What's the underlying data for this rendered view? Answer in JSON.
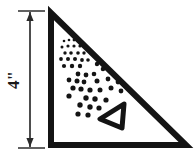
{
  "figure": {
    "background_color": "#ffffff",
    "ink_color": "#141414",
    "dimension": {
      "label": "4\"",
      "value": 4,
      "unit": "inch",
      "orientation": "vertical",
      "label_rotation_deg": -90,
      "line_x": 30,
      "line_top_y": 12,
      "line_bottom_y": 147,
      "arrowhead": "both-ends",
      "extension_top": {
        "x1": 18,
        "x2": 45,
        "y": 11
      },
      "extension_bottom": {
        "x1": 18,
        "x2": 45,
        "y": 148
      },
      "label_x": 19,
      "label_y": 80
    },
    "main_triangle": {
      "name": "right-triangle",
      "apex": {
        "x": 51,
        "y": 13
      },
      "bottom_left": {
        "x": 51,
        "y": 145
      },
      "bottom_right": {
        "x": 186,
        "y": 145
      },
      "stroke_width": 6,
      "fill": "none",
      "right_angle_at": "bottom-left"
    },
    "inner_triangle": {
      "name": "small-outlined-triangle",
      "points": "124,104 100,119 122,128",
      "stroke_width": 5,
      "fill": "none",
      "orientation": "points-left"
    },
    "dot_field": {
      "description": "Scattered round dots, small at upper-left, larger toward lower-right",
      "dots": [
        {
          "cx": 64,
          "cy": 41,
          "r": 1.3
        },
        {
          "cx": 69,
          "cy": 40,
          "r": 1.3
        },
        {
          "cx": 74,
          "cy": 40,
          "r": 1.4
        },
        {
          "cx": 79,
          "cy": 40,
          "r": 1.3
        },
        {
          "cx": 62,
          "cy": 47,
          "r": 1.5
        },
        {
          "cx": 68,
          "cy": 46,
          "r": 1.6
        },
        {
          "cx": 74,
          "cy": 46,
          "r": 1.6
        },
        {
          "cx": 80,
          "cy": 46,
          "r": 1.6
        },
        {
          "cx": 86,
          "cy": 47,
          "r": 1.5
        },
        {
          "cx": 65,
          "cy": 53,
          "r": 1.7
        },
        {
          "cx": 71,
          "cy": 53,
          "r": 1.8
        },
        {
          "cx": 78,
          "cy": 53,
          "r": 1.8
        },
        {
          "cx": 84,
          "cy": 53,
          "r": 1.7
        },
        {
          "cx": 61,
          "cy": 59,
          "r": 1.9
        },
        {
          "cx": 68,
          "cy": 59,
          "r": 2.0
        },
        {
          "cx": 75,
          "cy": 59,
          "r": 2.0
        },
        {
          "cx": 82,
          "cy": 60,
          "r": 1.9
        },
        {
          "cx": 88,
          "cy": 60,
          "r": 1.8
        },
        {
          "cx": 64,
          "cy": 66,
          "r": 2.1
        },
        {
          "cx": 72,
          "cy": 66,
          "r": 2.2
        },
        {
          "cx": 80,
          "cy": 66,
          "r": 2.2
        },
        {
          "cx": 97,
          "cy": 64,
          "r": 2.2
        },
        {
          "cx": 103,
          "cy": 69,
          "r": 2.3
        },
        {
          "cx": 78,
          "cy": 74,
          "r": 2.4
        },
        {
          "cx": 86,
          "cy": 75,
          "r": 2.4
        },
        {
          "cx": 94,
          "cy": 74,
          "r": 2.3
        },
        {
          "cx": 69,
          "cy": 80,
          "r": 2.4
        },
        {
          "cx": 77,
          "cy": 81,
          "r": 2.5
        },
        {
          "cx": 84,
          "cy": 82,
          "r": 2.4
        },
        {
          "cx": 97,
          "cy": 81,
          "r": 2.5
        },
        {
          "cx": 108,
          "cy": 79,
          "r": 2.4
        },
        {
          "cx": 118,
          "cy": 82,
          "r": 2.4
        },
        {
          "cx": 73,
          "cy": 88,
          "r": 2.6
        },
        {
          "cx": 81,
          "cy": 89,
          "r": 2.6
        },
        {
          "cx": 90,
          "cy": 90,
          "r": 2.6
        },
        {
          "cx": 100,
          "cy": 90,
          "r": 2.5
        },
        {
          "cx": 111,
          "cy": 88,
          "r": 2.5
        },
        {
          "cx": 121,
          "cy": 91,
          "r": 2.4
        },
        {
          "cx": 69,
          "cy": 96,
          "r": 2.6
        },
        {
          "cx": 86,
          "cy": 98,
          "r": 2.7
        },
        {
          "cx": 95,
          "cy": 99,
          "r": 2.7
        },
        {
          "cx": 106,
          "cy": 100,
          "r": 2.6
        },
        {
          "cx": 80,
          "cy": 105,
          "r": 2.7
        },
        {
          "cx": 90,
          "cy": 107,
          "r": 2.7
        },
        {
          "cx": 99,
          "cy": 108,
          "r": 2.6
        },
        {
          "cx": 78,
          "cy": 114,
          "r": 2.6
        },
        {
          "cx": 88,
          "cy": 115,
          "r": 2.6
        }
      ]
    }
  }
}
